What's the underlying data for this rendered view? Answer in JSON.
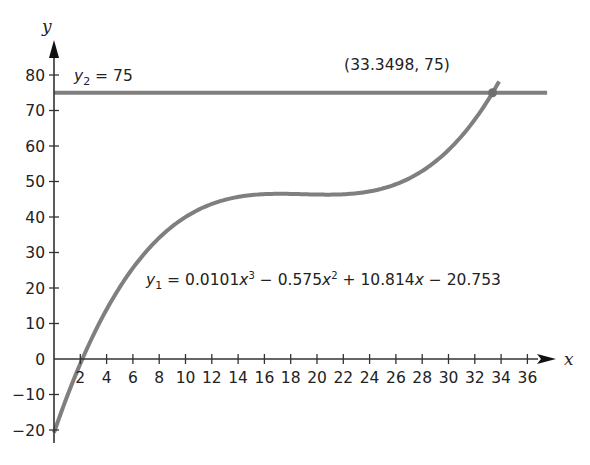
{
  "chart_data": {
    "type": "line",
    "title": "",
    "xlabel": "x",
    "ylabel": "y",
    "xlim": [
      0,
      38
    ],
    "ylim": [
      -24,
      86
    ],
    "grid": false,
    "x_ticks": [
      2,
      4,
      6,
      8,
      10,
      12,
      14,
      16,
      18,
      20,
      22,
      24,
      26,
      28,
      30,
      32,
      34,
      36
    ],
    "x_tick_labels": [
      "2",
      "4",
      "6",
      "8",
      "10",
      "12",
      "14",
      "16",
      "18",
      "20",
      "22",
      "24",
      "26",
      "28",
      "30",
      "32",
      "34",
      "36"
    ],
    "y_ticks": [
      -20,
      -10,
      0,
      10,
      20,
      30,
      40,
      50,
      60,
      70,
      80
    ],
    "y_tick_labels": [
      "−20",
      "−10",
      "0",
      "10",
      "20",
      "30",
      "40",
      "50",
      "60",
      "70",
      "80"
    ],
    "series": [
      {
        "name": "y1",
        "kind": "cubic",
        "coefficients": {
          "a": 0.0101,
          "b": -0.575,
          "c": 10.814,
          "d": -20.753
        },
        "x_range": [
          0,
          33.85
        ],
        "label": {
          "var": "y",
          "sub": "1",
          "text": "= 0.0101x³ − 0.575x² + 10.814x − 20.753",
          "parts": [
            {
              "t": " = 0.0101",
              "i": false
            },
            {
              "t": "x",
              "i": true
            },
            {
              "t": "3",
              "sup": true
            },
            {
              "t": " − 0.575",
              "i": false
            },
            {
              "t": "x",
              "i": true
            },
            {
              "t": "2",
              "sup": true
            },
            {
              "t": " + 10.814",
              "i": false
            },
            {
              "t": "x",
              "i": true
            },
            {
              "t": " − 20.753",
              "i": false
            }
          ]
        },
        "color": "#7f7f7f"
      },
      {
        "name": "y2",
        "kind": "horizontal",
        "value": 75,
        "x_range": [
          0,
          37.5
        ],
        "label": {
          "var": "y",
          "sub": "2",
          "text": "= 75"
        },
        "color": "#7f7f7f"
      }
    ],
    "annotations": [
      {
        "text": "(33.3498, 75)",
        "x": 33.3498,
        "y": 75,
        "marker": "point"
      }
    ]
  },
  "axes": {
    "x_label": "x",
    "y_label": "y",
    "axis_color": "#333333",
    "curve_color": "#7f7f7f"
  },
  "labels": {
    "intersection": "(33.3498, 75)",
    "y2_eq": "= 75",
    "y1_prefix": "y",
    "y1_sub": "1",
    "y2_prefix": "y",
    "y2_sub": "2"
  }
}
